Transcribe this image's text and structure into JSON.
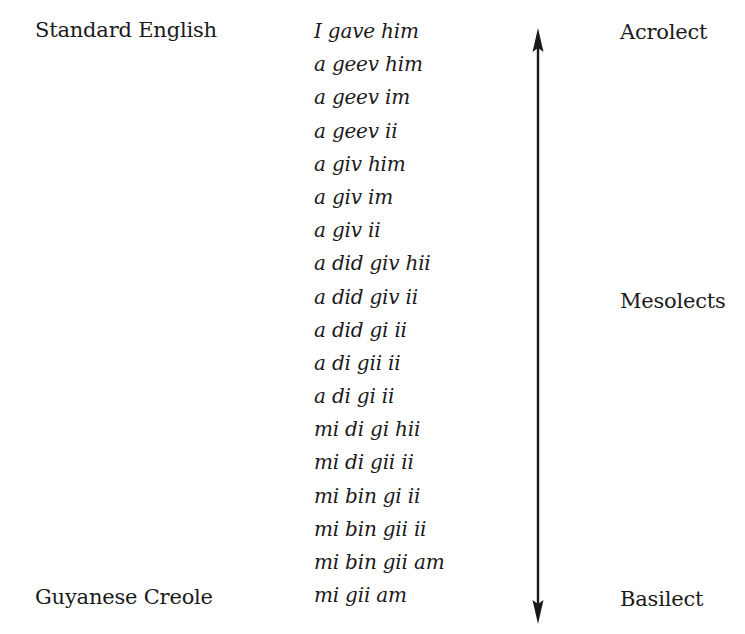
{
  "diagram": {
    "type": "creole-continuum",
    "left_labels": {
      "top": "Standard English",
      "bottom": "Guyanese Creole"
    },
    "right_labels": {
      "top": "Acrolect",
      "middle": "Mesolects",
      "bottom": "Basilect"
    },
    "forms": [
      "I gave him",
      "a geev him",
      "a geev im",
      "a geev ii",
      "a giv him",
      "a giv im",
      "a giv ii",
      "a did giv hii",
      "a did giv ii",
      "a did gi ii",
      "a di gii ii",
      "a di gi ii",
      "mi di gi hii",
      "mi di gii ii",
      "mi bin gi ii",
      "mi bin gii ii",
      "mi bin gii am",
      "mi gii am"
    ],
    "arrow": {
      "direction": "bidirectional-vertical",
      "icon": "double-headed-arrow-icon",
      "color": "#1a1a1a"
    }
  }
}
